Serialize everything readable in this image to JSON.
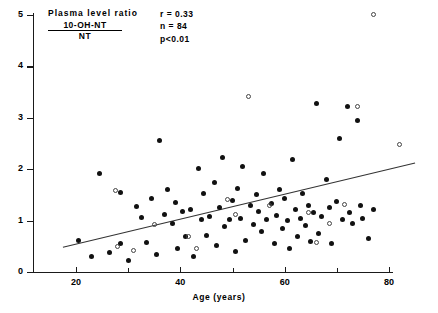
{
  "annotation": {
    "title": "Plasma level ratio",
    "numerator": "10-OH-NT",
    "denominator": "NT",
    "stat_r": "r = 0.33",
    "stat_n": "n = 84",
    "stat_p": "p<0.01"
  },
  "axes": {
    "xlabel": "Age (years)",
    "ylabel": "",
    "xticks": [
      20,
      40,
      60,
      80
    ],
    "xminor": [
      30,
      50,
      70
    ],
    "yticks": [
      0,
      1,
      2,
      3,
      4,
      5
    ],
    "xlim": [
      14,
      87
    ],
    "ylim": [
      0,
      5.15
    ]
  },
  "chart_data": {
    "type": "scatter",
    "xlabel": "Age (years)",
    "ylabel": "10-OH-NT / NT ratio",
    "xlim": [
      14,
      87
    ],
    "ylim": [
      0,
      5.15
    ],
    "grid": false,
    "legend": null,
    "annotations": [
      "r = 0.33",
      "n = 84",
      "p<0.01"
    ],
    "statistics": {
      "r": 0.33,
      "n": 84,
      "p": "<0.01"
    },
    "regression_line": {
      "x": [
        17.5,
        85.0
      ],
      "y": [
        0.48,
        2.12
      ]
    },
    "series": [
      {
        "name": "filled",
        "marker": "filled-circle",
        "color": "#111111",
        "points": [
          [
            20.5,
            0.62
          ],
          [
            23.0,
            0.3
          ],
          [
            24.5,
            1.92
          ],
          [
            26.5,
            0.38
          ],
          [
            28.5,
            1.55
          ],
          [
            28.5,
            0.55
          ],
          [
            30.0,
            0.22
          ],
          [
            31.5,
            1.27
          ],
          [
            32.5,
            1.06
          ],
          [
            33.5,
            0.58
          ],
          [
            34.5,
            1.44
          ],
          [
            35.5,
            0.35
          ],
          [
            36.0,
            2.55
          ],
          [
            37.0,
            1.12
          ],
          [
            37.5,
            1.6
          ],
          [
            38.5,
            0.95
          ],
          [
            39.0,
            1.35
          ],
          [
            39.5,
            0.45
          ],
          [
            40.5,
            1.18
          ],
          [
            41.0,
            0.7
          ],
          [
            42.0,
            1.22
          ],
          [
            42.5,
            0.3
          ],
          [
            43.5,
            2.02
          ],
          [
            44.0,
            1.02
          ],
          [
            44.5,
            1.52
          ],
          [
            45.0,
            0.72
          ],
          [
            45.5,
            1.08
          ],
          [
            46.5,
            1.74
          ],
          [
            47.0,
            0.52
          ],
          [
            47.5,
            1.25
          ],
          [
            48.0,
            2.22
          ],
          [
            48.5,
            0.88
          ],
          [
            49.5,
            1.03
          ],
          [
            50.0,
            1.4
          ],
          [
            50.5,
            0.4
          ],
          [
            51.0,
            1.62
          ],
          [
            51.5,
            1.05
          ],
          [
            52.0,
            2.05
          ],
          [
            52.5,
            0.62
          ],
          [
            53.5,
            1.3
          ],
          [
            54.0,
            0.92
          ],
          [
            54.5,
            1.5
          ],
          [
            55.0,
            1.18
          ],
          [
            55.5,
            0.78
          ],
          [
            56.0,
            1.92
          ],
          [
            56.5,
            1.02
          ],
          [
            57.5,
            1.34
          ],
          [
            58.0,
            0.55
          ],
          [
            58.5,
            1.1
          ],
          [
            59.0,
            1.6
          ],
          [
            59.5,
            0.85
          ],
          [
            60.0,
            1.44
          ],
          [
            60.5,
            1.0
          ],
          [
            61.0,
            0.45
          ],
          [
            61.5,
            2.18
          ],
          [
            62.0,
            1.22
          ],
          [
            62.5,
            0.7
          ],
          [
            63.0,
            1.05
          ],
          [
            63.5,
            1.52
          ],
          [
            64.0,
            0.9
          ],
          [
            64.5,
            1.3
          ],
          [
            65.0,
            0.6
          ],
          [
            65.5,
            1.15
          ],
          [
            66.0,
            3.28
          ],
          [
            66.5,
            0.75
          ],
          [
            67.0,
            1.08
          ],
          [
            68.0,
            1.8
          ],
          [
            68.5,
            1.25
          ],
          [
            69.0,
            0.55
          ],
          [
            70.0,
            1.38
          ],
          [
            70.5,
            2.6
          ],
          [
            71.0,
            1.02
          ],
          [
            72.0,
            3.22
          ],
          [
            72.5,
            1.15
          ],
          [
            73.0,
            0.95
          ],
          [
            74.0,
            2.95
          ],
          [
            74.5,
            1.3
          ],
          [
            75.0,
            1.05
          ],
          [
            76.0,
            0.65
          ],
          [
            77.0,
            1.22
          ]
        ]
      },
      {
        "name": "open",
        "marker": "open-circle",
        "color": "#444444",
        "points": [
          [
            27.5,
            1.58
          ],
          [
            28.0,
            0.5
          ],
          [
            31.0,
            0.42
          ],
          [
            35.0,
            0.92
          ],
          [
            41.5,
            0.7
          ],
          [
            43.0,
            0.45
          ],
          [
            49.0,
            1.42
          ],
          [
            50.5,
            1.12
          ],
          [
            53.0,
            3.42
          ],
          [
            57.0,
            1.3
          ],
          [
            64.5,
            1.15
          ],
          [
            66.0,
            0.58
          ],
          [
            68.5,
            0.95
          ],
          [
            71.5,
            1.32
          ],
          [
            74.0,
            3.22
          ],
          [
            77.0,
            5.02
          ],
          [
            82.0,
            2.48
          ]
        ]
      }
    ]
  }
}
